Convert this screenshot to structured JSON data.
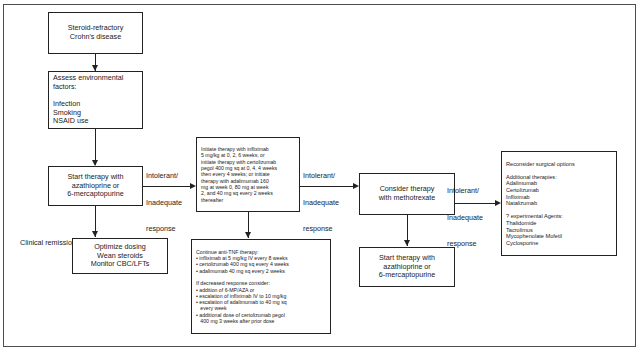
{
  "diagram": {
    "type": "flowchart",
    "nodes": {
      "start": {
        "name": "steroid-refractory-crohns-disease",
        "lines": [
          "Steroid-refractory",
          "Crohn's disease"
        ]
      },
      "assess": {
        "name": "assess-environmental-factors",
        "lines": [
          "Assess environmental",
          "factors:",
          "",
          "Infection",
          "Smoking",
          "NSAID use"
        ]
      },
      "start_therapy_aza": {
        "name": "start-therapy-azathioprine",
        "lines": [
          "Start therapy with",
          "azathioprine or",
          "6-mercaptopurine"
        ]
      },
      "optimize": {
        "name": "optimize-dosing",
        "lines": [
          "Optimize dosing",
          "Wean steroids",
          "Monitor CBC/LFTs"
        ]
      },
      "initiate_antitnf": {
        "name": "initiate-anti-tnf-therapy",
        "lines": [
          "Initiate therapy with infliximab",
          "5 mg/kg at 0, 2, 6 weeks; or",
          "initiate therapy with certolizumab",
          "pegol 400 mg sq at 0, 4, 4 weeks",
          "then every 4 weeks; or initiate",
          "therapy with adalimumab 160",
          "mg at week 0, 80 mg at week",
          "2, and 40 mg sq every 2 weeks",
          "thereafter"
        ]
      },
      "continue_antitnf": {
        "name": "continue-anti-tnf-therapy",
        "lines": [
          "Continue anti-TNF therapy:",
          "• infliximab at 5 mg/kg IV every 8 weeks",
          "• certolizumab 400 mg sq every 4 weeks",
          "• adalimumab 40 mg sq every 2 weeks",
          "",
          "If decreased response consider:",
          "• addition of 6-MP/AZA or",
          "• escalation of infliximab IV to 10 mg/kg",
          "• escalation of adalimumab to 40 mg sq",
          "   every week",
          "• additional dose of certolizumab pegol",
          "   400 mg 3 weeks after prior dose"
        ]
      },
      "methotrexate": {
        "name": "consider-therapy-methotrexate",
        "lines": [
          "Consider therapy",
          "with methotrexate"
        ]
      },
      "start_therapy_aza_2": {
        "name": "start-therapy-azathioprine-secondary",
        "lines": [
          "Start therapy with",
          "azathioprine or",
          "6-mercaptopurine"
        ]
      },
      "surgical": {
        "name": "reconsider-surgical-options",
        "lines": [
          "Reconsider surgical options",
          "",
          "Additional therapies:",
          "Adalimumab",
          "Certolizumab",
          "Infliximab",
          "Natalizumab",
          "",
          "? experimental Agents:",
          "Thalidomide",
          "Tacrolimus",
          "Mycophenolate Mofetil",
          "Cyclosporine"
        ]
      }
    },
    "edge_labels": {
      "intolerant_1": {
        "name": "edge-label-intolerant-1",
        "lines": [
          "Intolerant/",
          "Inadequate",
          "response"
        ]
      },
      "intolerant_2": {
        "name": "edge-label-intolerant-2",
        "lines": [
          "Intolerant/",
          "Inadequate",
          "response"
        ]
      },
      "intolerant_3": {
        "name": "edge-label-intolerant-3",
        "lines": [
          "Intolerant/",
          "Inadequate",
          "response"
        ]
      },
      "clinical_remission": {
        "name": "edge-label-clinical-remission",
        "lines": [
          "Clinical remission"
        ]
      }
    },
    "colors": {
      "border": "#222222",
      "frame": "#4d4d4d",
      "text": "#1a1a1a",
      "background": "#ffffff"
    }
  }
}
